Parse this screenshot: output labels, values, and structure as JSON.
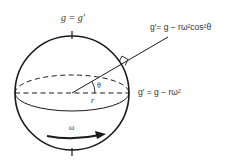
{
  "diagram": {
    "labels": {
      "pole": "g = g′",
      "latitude": "g′= g − rω²cos²θ",
      "equator": "g′ = g − rω²",
      "angle": "θ",
      "radius": "r",
      "omega": "ω"
    },
    "colors": {
      "stroke": "#1a1a1a",
      "text": "#333333",
      "background": "#ffffff"
    }
  }
}
